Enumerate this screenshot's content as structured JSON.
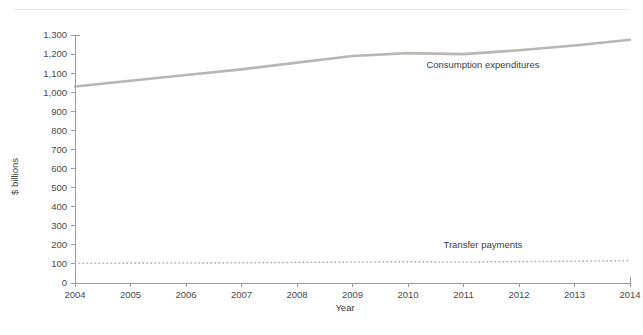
{
  "figure": {
    "header_note": "",
    "background_color": "#ffffff"
  },
  "chart_data": {
    "type": "line",
    "title": "",
    "xlabel": "Year",
    "ylabel": "$ billions",
    "x": [
      2004,
      2005,
      2006,
      2007,
      2008,
      2009,
      2010,
      2011,
      2012,
      2013,
      2014
    ],
    "categories": [
      "2004",
      "2005",
      "2006",
      "2007",
      "2008",
      "2009",
      "2010",
      "2011",
      "2012",
      "2013",
      "2014"
    ],
    "xlim": [
      2004,
      2014
    ],
    "ylim": [
      0,
      1300
    ],
    "y_ticks": [
      0,
      100,
      200,
      300,
      400,
      500,
      600,
      700,
      800,
      900,
      1000,
      1100,
      1200,
      1300
    ],
    "y_tick_labels": [
      "0",
      "100",
      "200",
      "300",
      "400",
      "500",
      "600",
      "700",
      "800",
      "900",
      "1,000",
      "1,100",
      "1,200",
      "1,300"
    ],
    "x_tick_labels": [
      "2004",
      "2005",
      "2006",
      "2007",
      "2008",
      "2009",
      "2010",
      "2011",
      "2012",
      "2013",
      "2014"
    ],
    "grid": false,
    "legend_position": "inline-annotation",
    "series": [
      {
        "name": "Consumption expenditures",
        "style": "solid",
        "color": "#bab6b2",
        "label_x": 2011.35,
        "label_y": 1125,
        "values": [
          1030,
          1060,
          1090,
          1120,
          1155,
          1190,
          1205,
          1200,
          1220,
          1245,
          1275
        ]
      },
      {
        "name": "Transfer payments",
        "style": "dotted",
        "color": "#b6b2ae",
        "label_x": 2011.35,
        "label_y": 185,
        "values": [
          103,
          104,
          105,
          106,
          108,
          110,
          111,
          110,
          112,
          114,
          117
        ]
      }
    ]
  }
}
